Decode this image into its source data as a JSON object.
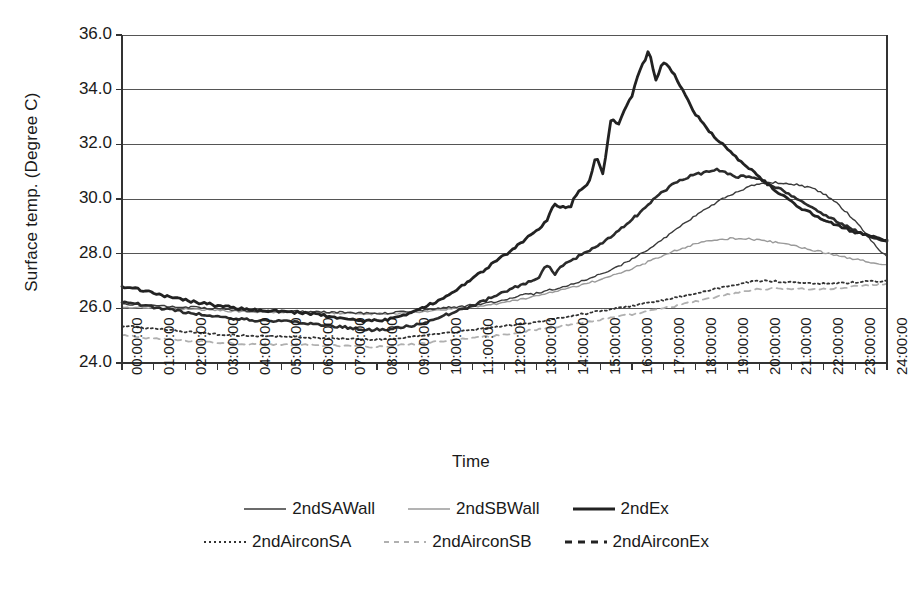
{
  "chart_data": {
    "type": "line",
    "title": "",
    "xlabel": "Time",
    "ylabel": "Surface temp. (Degree C)",
    "ylim": [
      24.0,
      36.0
    ],
    "ytick_labels": [
      "36.0",
      "34.0",
      "32.0",
      "30.0",
      "28.0",
      "26.0",
      "24.0"
    ],
    "ytick_values": [
      36.0,
      34.0,
      32.0,
      30.0,
      28.0,
      26.0,
      24.0
    ],
    "grid": "horizontal",
    "legend_position": "bottom",
    "x": [
      "00:00:00",
      "01:00:00",
      "02:00:00",
      "03:00:00",
      "04:00:00",
      "05:00:00",
      "06:00:00",
      "07:00:00",
      "08:00:00",
      "09:00:00",
      "10:00:00",
      "11:00:00",
      "12:00:00",
      "13:00:00",
      "14:00:00",
      "15:00:00",
      "16:00:00",
      "17:00:00",
      "18:00:00",
      "19:00:00",
      "20:00:00",
      "21:00:00",
      "22:00:00",
      "23:00:00",
      "24:00:00"
    ],
    "categories": [
      "00:00:00",
      "01:00:00",
      "02:00:00",
      "03:00:00",
      "04:00:00",
      "05:00:00",
      "06:00:00",
      "07:00:00",
      "08:00:00",
      "09:00:00",
      "10:00:00",
      "11:00:00",
      "12:00:00",
      "13:00:00",
      "14:00:00",
      "15:00:00",
      "16:00:00",
      "17:00:00",
      "18:00:00",
      "19:00:00",
      "20:00:00",
      "21:00:00",
      "22:00:00",
      "23:00:00",
      "24:00:00"
    ],
    "series": [
      {
        "name": "2ndSAWall",
        "color": "#3a3a3a",
        "width": 1.4,
        "dash": "none",
        "values": [
          26.15,
          26.1,
          26.05,
          25.98,
          25.92,
          25.9,
          25.88,
          25.85,
          25.82,
          25.88,
          26.0,
          26.12,
          26.3,
          26.55,
          26.85,
          27.25,
          27.8,
          28.55,
          29.4,
          30.1,
          30.55,
          30.55,
          30.2,
          29.2,
          27.9
        ],
        "y_at_start": 26.15,
        "y_at_end": 27.9,
        "peak": 30.6,
        "peak_time": "19:30:00"
      },
      {
        "name": "2ndSBWall",
        "color": "#9a9a9a",
        "width": 1.4,
        "dash": "none",
        "values": [
          26.05,
          26.02,
          25.98,
          25.92,
          25.88,
          25.86,
          25.84,
          25.82,
          25.8,
          25.84,
          25.95,
          26.05,
          26.22,
          26.45,
          26.72,
          27.05,
          27.45,
          27.95,
          28.35,
          28.55,
          28.5,
          28.3,
          28.05,
          27.8,
          27.6
        ],
        "y_at_start": 26.05,
        "y_at_end": 27.6,
        "peak": 28.6,
        "peak_time": "19:00:00"
      },
      {
        "name": "2ndEx",
        "color": "#222222",
        "width": 2.8,
        "dash": "none",
        "values": [
          26.8,
          26.55,
          26.3,
          26.1,
          25.95,
          25.88,
          25.8,
          25.6,
          25.55,
          25.8,
          26.35,
          27.1,
          27.95,
          28.85,
          29.9,
          31.2,
          33.8,
          34.95,
          33.1,
          31.8,
          30.8,
          29.9,
          29.25,
          28.8,
          28.5
        ],
        "y_at_start": 26.8,
        "y_at_end": 28.5,
        "peak": 35.6,
        "peak_time": "16:20:00"
      },
      {
        "name": "2ndAirconSA",
        "color": "#333333",
        "width": 1.8,
        "dash": "dotted",
        "values": [
          25.35,
          25.25,
          25.15,
          25.05,
          25.0,
          24.98,
          24.92,
          24.88,
          24.85,
          24.95,
          25.08,
          25.2,
          25.35,
          25.5,
          25.7,
          25.9,
          26.1,
          26.3,
          26.55,
          26.8,
          27.0,
          26.95,
          26.9,
          26.95,
          27.0
        ],
        "y_at_start": 25.35,
        "y_at_end": 27.0,
        "peak": 27.1,
        "peak_time": "20:00:00"
      },
      {
        "name": "2ndAirconSB",
        "color": "#b0b0b0",
        "width": 1.8,
        "dash": "dashed",
        "values": [
          25.0,
          24.9,
          24.82,
          24.75,
          24.7,
          24.68,
          24.65,
          24.62,
          24.6,
          24.68,
          24.8,
          24.92,
          25.05,
          25.22,
          25.4,
          25.58,
          25.78,
          26.0,
          26.25,
          26.5,
          26.7,
          26.72,
          26.7,
          26.8,
          26.9
        ],
        "y_at_start": 25.0,
        "y_at_end": 26.9,
        "peak": 26.95,
        "peak_time": "24:00:00"
      },
      {
        "name": "2ndAirconEx",
        "color": "#2b2b2b",
        "width": 2.6,
        "dash": "none",
        "values": [
          26.25,
          26.05,
          25.85,
          25.7,
          25.58,
          25.52,
          25.42,
          25.3,
          25.22,
          25.35,
          25.7,
          26.1,
          26.6,
          27.1,
          27.7,
          28.35,
          29.25,
          30.3,
          30.9,
          30.95,
          30.7,
          30.15,
          29.45,
          28.85,
          28.45
        ],
        "y_at_start": 26.25,
        "y_at_end": 28.45,
        "peak": 31.0,
        "peak_time": "18:30:00"
      }
    ]
  },
  "legend": {
    "rows": [
      [
        {
          "name": "2ndSAWall",
          "style": "solid-thin-dark"
        },
        {
          "name": "2ndSBWall",
          "style": "solid-thin-light"
        },
        {
          "name": "2ndEx",
          "style": "solid-thick-dark"
        }
      ],
      [
        {
          "name": "2ndAirconSA",
          "style": "dotted-dark"
        },
        {
          "name": "2ndAirconSB",
          "style": "dashed-light"
        },
        {
          "name": "2ndAirconEx",
          "style": "dashed-thick-dark"
        }
      ]
    ]
  },
  "colors": {
    "axis": "#333333",
    "grid": "#555555",
    "background": "#ffffff"
  }
}
